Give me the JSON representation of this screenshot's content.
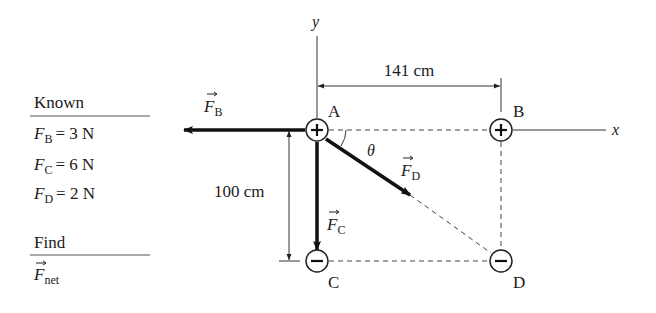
{
  "known": {
    "heading": "Known",
    "items": [
      {
        "symbol": "F",
        "subscript": "B",
        "equals": "= 3 N"
      },
      {
        "symbol": "F",
        "subscript": "C",
        "equals": "= 6 N"
      },
      {
        "symbol": "F",
        "subscript": "D",
        "equals": "= 2 N"
      }
    ]
  },
  "find": {
    "heading": "Find",
    "symbol": "F",
    "subscript": "net"
  },
  "axes": {
    "x_label": "x",
    "y_label": "y"
  },
  "charges": {
    "A": {
      "label": "A",
      "sign": "+"
    },
    "B": {
      "label": "B",
      "sign": "+"
    },
    "C": {
      "label": "C",
      "sign": "−"
    },
    "D": {
      "label": "D",
      "sign": "−"
    }
  },
  "dimensions": {
    "horizontal": "141 cm",
    "vertical": "100 cm"
  },
  "angle_label": "θ",
  "forces": {
    "FB": {
      "symbol": "F",
      "subscript": "B"
    },
    "FC": {
      "symbol": "F",
      "subscript": "C"
    },
    "FD": {
      "symbol": "F",
      "subscript": "D"
    }
  }
}
